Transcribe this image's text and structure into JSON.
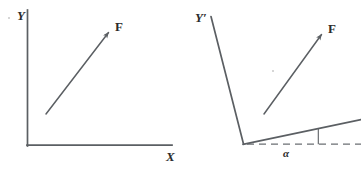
{
  "figure": {
    "background_color": "#ffffff",
    "stroke_color": "#5b5f63",
    "text_color": "#2b2b2b",
    "panels": [
      {
        "name": "unrotated-frame",
        "axes": [
          {
            "name": "y-axis",
            "label": "Y"
          },
          {
            "name": "x-axis",
            "label": "X"
          }
        ],
        "vectors": [
          {
            "name": "force-vector",
            "label": "F"
          }
        ]
      },
      {
        "name": "rotated-frame",
        "axes": [
          {
            "name": "y-prime-axis",
            "label": "Y′"
          },
          {
            "name": "x-prime-axis",
            "label": ""
          }
        ],
        "vectors": [
          {
            "name": "force-vector",
            "label": "F"
          }
        ],
        "angles": [
          {
            "name": "rotation-angle",
            "label": "α"
          }
        ],
        "reference_line": {
          "name": "horizontal-dashed-reference",
          "style": "dashed"
        }
      }
    ]
  },
  "labels": {
    "left_y": "Y",
    "left_x": "X",
    "left_force": "F",
    "right_y_prime": "Y′",
    "right_force": "F",
    "alpha": "α"
  }
}
